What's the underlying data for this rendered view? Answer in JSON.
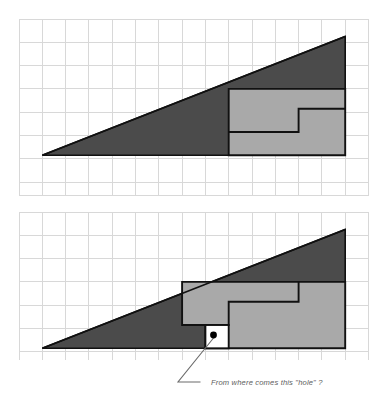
{
  "page": {
    "background_color": "#ffffff"
  },
  "palette": {
    "grid_line": "#d8d8d8",
    "grid_line_strong": "#cfcfcf",
    "dark_gray_fill": "#4b4b4b",
    "light_gray_fill": "#a9a9a9",
    "outline": "#111111",
    "dot": "#000000",
    "leader_line": "#6b6b6b",
    "caption_color": "#5d5d5d",
    "white_hole": "#ffffff"
  },
  "grid": {
    "cell_size_px": 23.3,
    "columns": 15,
    "top_panel_rows": 7.6,
    "bottom_panel_rows": 6.4,
    "visible": true,
    "label": "square grid background"
  },
  "figures": [
    {
      "id": "figure-top",
      "name": "top-arrangement",
      "description": "Right triangle split into a dark upper region and a light gray stepped region at the right, fitted without any gap",
      "shapes": [
        {
          "name": "dark-triangle-region",
          "fill": "dark_gray_fill",
          "points_grid": [
            [
              1,
              6
            ],
            [
              14,
              0.75
            ],
            [
              14,
              6
            ]
          ]
        },
        {
          "name": "light-stepped-region",
          "fill": "light_gray_fill",
          "points_grid": [
            [
              9,
              3
            ],
            [
              14,
              3
            ],
            [
              14,
              6
            ],
            [
              9,
              6
            ]
          ],
          "step_notch_grid": [
            [
              9,
              5
            ],
            [
              12,
              5
            ],
            [
              12,
              4
            ],
            [
              14,
              4
            ]
          ]
        }
      ],
      "hole": null
    },
    {
      "id": "figure-bottom",
      "name": "bottom-arrangement",
      "description": "Same pieces rearranged: the stepped light gray region is shifted left, producing a one-cell square hole along the baseline",
      "shapes": [
        {
          "name": "dark-triangle-region",
          "fill": "dark_gray_fill",
          "points_grid": [
            [
              1,
              6
            ],
            [
              14,
              0.75
            ],
            [
              14,
              6
            ]
          ]
        },
        {
          "name": "light-stepped-region",
          "fill": "light_gray_fill",
          "points_grid": [
            [
              7,
              3
            ],
            [
              14,
              3
            ],
            [
              14,
              6
            ],
            [
              7,
              6
            ]
          ],
          "step_notch_grid": [
            [
              7,
              5
            ],
            [
              10,
              5
            ],
            [
              10,
              4
            ],
            [
              13,
              4
            ],
            [
              13,
              3
            ]
          ]
        }
      ],
      "hole": {
        "name": "missing-square-hole",
        "fill": "white_hole",
        "rect_grid": [
          10,
          5,
          1,
          1
        ],
        "marker": "dot"
      }
    }
  ],
  "annotation": {
    "name": "hole-callout",
    "caption": "From where comes this \"hole\" ?",
    "leader": {
      "from_point_px": [
        213,
        347
      ],
      "elbow_point_px": [
        178,
        382
      ],
      "to_point_px": [
        200,
        382
      ]
    },
    "dot_radius_px": 3.4
  }
}
